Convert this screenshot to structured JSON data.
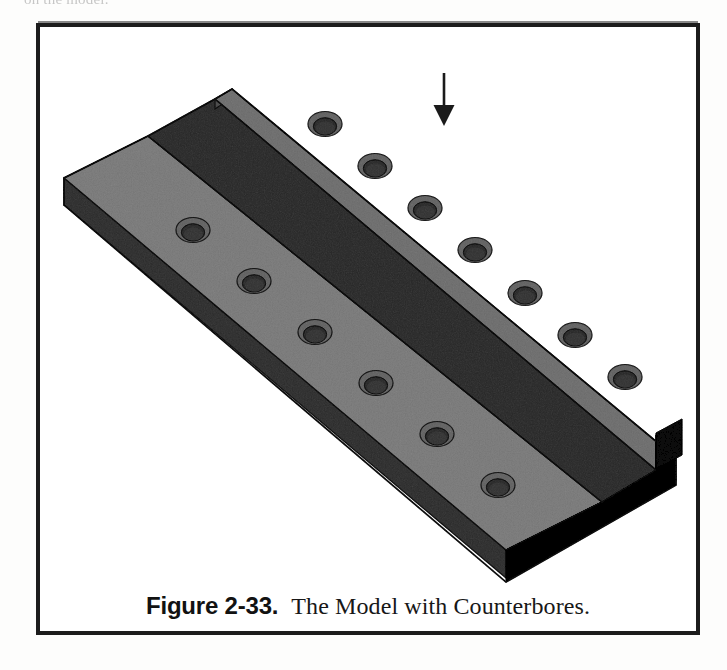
{
  "page": {
    "background_color": "#ffffff",
    "top_partial_text": "on the model."
  },
  "figure": {
    "frame": {
      "border_color": "#1c1c1c",
      "border_width_px": 4,
      "x": 36,
      "y": 23,
      "width": 664,
      "height": 612
    },
    "caption": {
      "label": "Figure 2-33.",
      "text": "The Model with Counterbores."
    },
    "annotation": {
      "arrow": {
        "name": "down-arrow-annotation",
        "direction": "down",
        "color": "#1a1a1a",
        "x": 444,
        "y_start": 72,
        "y_end": 125
      }
    },
    "model": {
      "name": "stepped-block-with-counterbores",
      "description": "Isometric solid model of a two-level stepped rectangular block with two parallel rows of counterbored holes.",
      "colors": {
        "top_face": "#b2b2b2",
        "top_face_upper_step": "#ababab",
        "side_face_left": "#7b7b7b",
        "side_face_front": "#8d8d8d",
        "end_face_dark": "#1f1f1f",
        "riser_face": "#6e6e6e",
        "outline": "#3a3a3a",
        "hole_bore_dark": "#5c5c5c",
        "hole_shadow": "#3d3d3d",
        "hole_rim_light": "#cccccc"
      },
      "counterbore_rows": [
        {
          "row": "upper-step-row",
          "count": 7,
          "holes": [
            {
              "cx": 289,
              "cy": 101
            },
            {
              "cx": 339,
              "cy": 143
            },
            {
              "cx": 389,
              "cy": 185
            },
            {
              "cx": 439,
              "cy": 227
            },
            {
              "cx": 489,
              "cy": 270
            },
            {
              "cx": 539,
              "cy": 312
            },
            {
              "cx": 589,
              "cy": 354
            }
          ]
        },
        {
          "row": "lower-step-row",
          "count": 6,
          "holes": [
            {
              "cx": 157,
              "cy": 207
            },
            {
              "cx": 218,
              "cy": 258
            },
            {
              "cx": 279,
              "cy": 309
            },
            {
              "cx": 340,
              "cy": 360
            },
            {
              "cx": 401,
              "cy": 411
            },
            {
              "cx": 462,
              "cy": 462
            }
          ]
        }
      ],
      "total_counterbores": 13
    }
  }
}
